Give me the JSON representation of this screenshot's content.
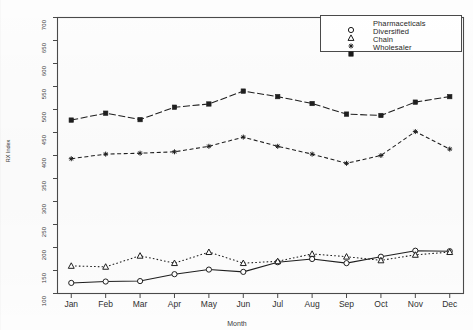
{
  "figure": {
    "background": "#fdfdfd",
    "frame_color": "#4a4a4a"
  },
  "legend": {
    "position": "top-right",
    "box_color": "#4a4a4a",
    "entries": [
      {
        "label": "Pharmaceticals",
        "marker": "circle-open-icon",
        "color": "#1a1a1a"
      },
      {
        "label": "Diversified",
        "marker": "triangle-open-icon",
        "color": "#1a1a1a"
      },
      {
        "label": "Chain",
        "marker": "asterisk-icon",
        "color": "#1a1a1a"
      },
      {
        "label": "Wholesaler",
        "marker": "square-filled-icon",
        "color": "#1a1a1a"
      }
    ]
  },
  "chart_data": {
    "type": "line",
    "title": "",
    "xlabel": "Month",
    "ylabel": "RX Index",
    "grid": false,
    "legend_position": "top-right",
    "categories": [
      "Jan",
      "Feb",
      "Mar",
      "Apr",
      "May",
      "Jun",
      "Jul",
      "Aug",
      "Sep",
      "Oct",
      "Nov",
      "Dec"
    ],
    "x": [
      1,
      2,
      3,
      4,
      5,
      6,
      7,
      8,
      9,
      10,
      11,
      12
    ],
    "xlim": [
      0.6,
      12.4
    ],
    "ylim": [
      100,
      700
    ],
    "ytick_labels": [
      "100",
      "150",
      "200",
      "250",
      "300",
      "350",
      "400",
      "450",
      "500",
      "550",
      "600",
      "650",
      "700"
    ],
    "yticks": [
      100,
      150,
      200,
      250,
      300,
      350,
      400,
      450,
      500,
      550,
      600,
      650,
      700
    ],
    "series": [
      {
        "name": "Pharmaceticals",
        "marker": "circle-open-icon",
        "linetype": "solid",
        "color": "#1f1f1f",
        "values": [
          123,
          126,
          127,
          142,
          152,
          147,
          168,
          175,
          166,
          180,
          193,
          192
        ]
      },
      {
        "name": "Diversified",
        "marker": "triangle-open-icon",
        "linetype": "dotted",
        "color": "#1f1f1f",
        "values": [
          160,
          158,
          182,
          166,
          190,
          166,
          170,
          186,
          180,
          172,
          184,
          190
        ]
      },
      {
        "name": "Chain",
        "marker": "asterisk-icon",
        "linetype": "dashed",
        "color": "#1f1f1f",
        "values": [
          393,
          403,
          405,
          408,
          420,
          440,
          420,
          403,
          383,
          400,
          452,
          414
        ]
      },
      {
        "name": "Wholesaler",
        "marker": "square-filled-icon",
        "linetype": "dash-dot",
        "color": "#1f1f1f",
        "values": [
          477,
          492,
          478,
          505,
          512,
          540,
          528,
          513,
          490,
          487,
          516,
          528
        ]
      }
    ]
  }
}
